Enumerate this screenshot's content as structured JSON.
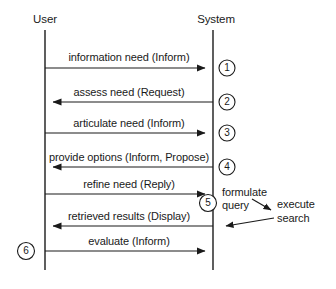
{
  "diagram": {
    "type": "sequence-diagram",
    "title": "",
    "width": 336,
    "height": 289,
    "colors": {
      "line": "#1a1a1a",
      "text": "#1a1a1a",
      "background": "#ffffff"
    },
    "actors": [
      {
        "id": "user",
        "label": "User",
        "lifeline_x": 45,
        "label_x": 45,
        "label_y": 14
      },
      {
        "id": "system",
        "label": "System",
        "lifeline_x": 213,
        "label_x": 216,
        "label_y": 14
      }
    ],
    "lifeline": {
      "top_y": 30,
      "bottom_y": 270
    },
    "messages": [
      {
        "step": "1",
        "label": "information need (Inform)",
        "from": "user",
        "to": "system",
        "direction": "right",
        "y": 68,
        "text_y": 51,
        "text_x": 129
      },
      {
        "step": "2",
        "label": "assess need (Request)",
        "from": "system",
        "to": "user",
        "direction": "left",
        "y": 102,
        "text_y": 86,
        "text_x": 129
      },
      {
        "step": "3",
        "label": "articulate need (Inform)",
        "from": "user",
        "to": "system",
        "direction": "right",
        "y": 133,
        "text_y": 117,
        "text_x": 129
      },
      {
        "step": "4",
        "label": "provide options (Inform, Propose)",
        "from": "system",
        "to": "user",
        "direction": "left",
        "y": 167,
        "text_y": 151,
        "text_x": 129
      },
      {
        "step": "5",
        "label": "refine need (Reply)",
        "from": "user",
        "to": "system",
        "direction": "right",
        "y": 194,
        "text_y": 178,
        "text_x": 129
      },
      {
        "step": "",
        "label": "retrieved results (Display)",
        "from": "system",
        "to": "user",
        "direction": "left",
        "y": 226,
        "text_y": 210,
        "text_x": 129
      },
      {
        "step": "6",
        "label": "evaluate (Inform)",
        "from": "system",
        "to": "user",
        "direction": "right",
        "y": 251,
        "text_y": 235,
        "text_x": 129
      }
    ],
    "step_markers": [
      {
        "label": "1",
        "cx": 227,
        "cy": 68,
        "r": 8
      },
      {
        "label": "2",
        "cx": 227,
        "cy": 102,
        "r": 8
      },
      {
        "label": "3",
        "cx": 227,
        "cy": 133,
        "r": 8
      },
      {
        "label": "4",
        "cx": 227,
        "cy": 167,
        "r": 8
      },
      {
        "label": "5",
        "cx": 208,
        "cy": 203,
        "r": 8.5
      },
      {
        "label": "6",
        "cx": 26,
        "cy": 251,
        "r": 8.5
      }
    ],
    "side_notes": [
      {
        "id": "formulate-query",
        "lines": [
          "formulate",
          "query"
        ],
        "x": 222,
        "y": 191
      },
      {
        "id": "execute-search",
        "lines": [
          "execute",
          "search"
        ],
        "x": 277,
        "y": 197
      }
    ],
    "side_arrows": [
      {
        "id": "formulate-to-execute",
        "x1": 252,
        "y1": 199,
        "x2": 274,
        "y2": 211
      },
      {
        "id": "execute-to-system",
        "x1": 272,
        "y1": 218,
        "x2": 219,
        "y2": 226
      }
    ]
  }
}
